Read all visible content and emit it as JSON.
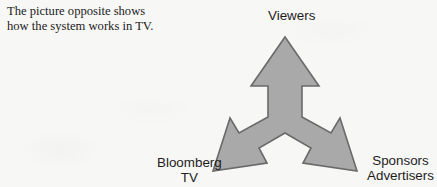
{
  "page": {
    "background_color": "#f7f7f5",
    "text_color": "#1b1b1b"
  },
  "caption": {
    "line1": "The picture opposite shows",
    "line2": "how the system works in TV."
  },
  "diagram": {
    "type": "three-way-arrow",
    "fill_color": "#a9a9a9",
    "stroke_color": "#6a6a6a",
    "center": {
      "x": 285,
      "y": 120
    },
    "nodes": [
      {
        "id": "viewers",
        "label": "Viewers",
        "direction": "up"
      },
      {
        "id": "bloomberg-tv",
        "label_line1": "Bloomberg",
        "label_line2": "TV",
        "direction": "down-left"
      },
      {
        "id": "sponsors-advertisers",
        "label_line1": "Sponsors",
        "label_line2": "Advertisers",
        "direction": "down-right"
      }
    ]
  }
}
